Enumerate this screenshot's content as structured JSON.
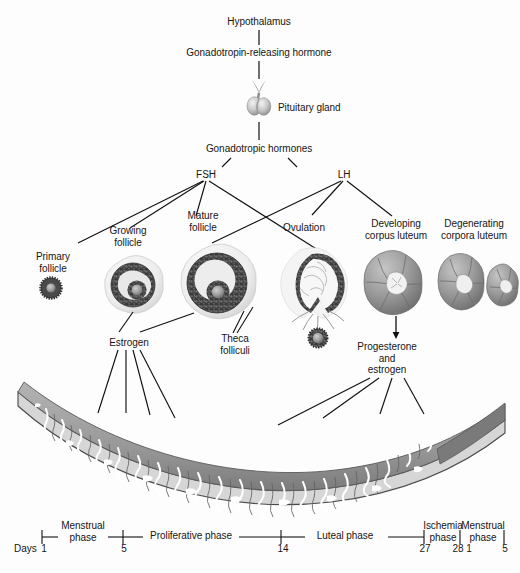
{
  "diagram": {
    "background": "#fdfdfd",
    "ink": "#161616"
  },
  "axis_chain": {
    "hypothalamus": "Hypothalamus",
    "gnrh": "Gonadotropin-releasing hormone",
    "pituitary": "Pituitary gland",
    "gonadotropins": "Gonadotropic hormones",
    "fsh": "FSH",
    "lh": "LH"
  },
  "ovary_stages": [
    {
      "id": "primary-follicle",
      "label": "Primary\nfollicle"
    },
    {
      "id": "growing-follicle",
      "label": "Growing\nfollicle"
    },
    {
      "id": "mature-follicle",
      "label": "Mature\nfollicle"
    },
    {
      "id": "theca-folliculi",
      "label": "Theca\nfolliculi"
    },
    {
      "id": "ovulation",
      "label": "Ovulation"
    },
    {
      "id": "developing-corpus-luteum",
      "label": "Developing\ncorpus luteum"
    },
    {
      "id": "degenerating-corpora-luteum",
      "label": "Degenerating\ncorpora luteum"
    }
  ],
  "hormones": {
    "estrogen": "Estrogen",
    "progesterone_and_estrogen": "Progesterone\nand\nestrogen"
  },
  "timeline": {
    "days_label": "Days",
    "ticks": [
      "1",
      "5",
      "14",
      "27",
      "28",
      "1",
      "5"
    ],
    "phases": [
      {
        "id": "menstrual-phase-1",
        "label": "Menstrual\nphase",
        "start_day": "1",
        "end_day": "5"
      },
      {
        "id": "proliferative-phase",
        "label": "Proliferative phase",
        "start_day": "5",
        "end_day": "14"
      },
      {
        "id": "luteal-phase",
        "label": "Luteal phase",
        "start_day": "14",
        "end_day": "27"
      },
      {
        "id": "ischemia-phase",
        "label": "Ischemia\nphase",
        "start_day": "27",
        "end_day": "28"
      },
      {
        "id": "menstrual-phase-2",
        "label": "Menstrual\nphase",
        "start_day": "1",
        "end_day": "5"
      }
    ]
  },
  "endometrium": {
    "id": "endometrium-cross-section",
    "description": "Endometrial lining thickness across the cycle"
  },
  "colors": {
    "line": "#111111",
    "granulosa_dark": "#3c3c3c",
    "follicle_fill": "#d8d8d8",
    "corpus_luteum": "#8f8f8f",
    "endometrium_mid": "#9a9a9a",
    "endometrium_dark": "#6e6e6e",
    "endometrium_light": "#c4c4c4"
  }
}
